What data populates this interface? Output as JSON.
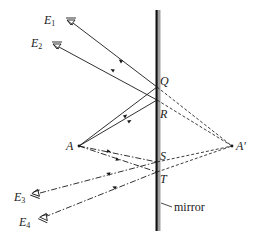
{
  "diagram": {
    "type": "plane-mirror-ray-diagram",
    "mirror": {
      "label": "mirror",
      "x": 157,
      "y_top": 10,
      "y_bottom": 231
    },
    "object_point": {
      "label": "A",
      "x": 79,
      "y": 146
    },
    "image_point": {
      "label": "A'",
      "x": 232,
      "y": 146
    },
    "reflection_points": [
      {
        "label": "Q",
        "x": 157,
        "y": 87
      },
      {
        "label": "R",
        "x": 157,
        "y": 100
      },
      {
        "label": "S",
        "x": 157,
        "y": 162
      },
      {
        "label": "T",
        "x": 157,
        "y": 172
      }
    ],
    "observers": [
      {
        "label": "E",
        "subscript": "1",
        "x": 71,
        "y": 20,
        "orientation": "up",
        "reflects_at": "Q"
      },
      {
        "label": "E",
        "subscript": "2",
        "x": 57,
        "y": 44,
        "orientation": "up",
        "reflects_at": "R"
      },
      {
        "label": "E",
        "subscript": "3",
        "x": 36,
        "y": 196,
        "orientation": "down",
        "reflects_at": "S"
      },
      {
        "label": "E",
        "subscript": "4",
        "x": 44,
        "y": 220,
        "orientation": "down",
        "reflects_at": "T"
      }
    ],
    "legend": {
      "solid_lines": "rays from A reflecting at Q, R to E1, E2",
      "dash_dot_lines": "rays from A reflecting at S, T to E3, E4",
      "dashed_lines": "virtual extensions behind mirror to image A'"
    },
    "colors": {
      "line": "#1a1a1a",
      "mirror_back": "#9a9a9a",
      "background": "#ffffff"
    }
  },
  "labels": {
    "E1": "E",
    "E1_sub": "1",
    "E2": "E",
    "E2_sub": "2",
    "E3": "E",
    "E3_sub": "3",
    "E4": "E",
    "E4_sub": "4",
    "Q": "Q",
    "R": "R",
    "S": "S",
    "T": "T",
    "A": "A",
    "A_prime": "A′",
    "mirror": "mirror"
  }
}
